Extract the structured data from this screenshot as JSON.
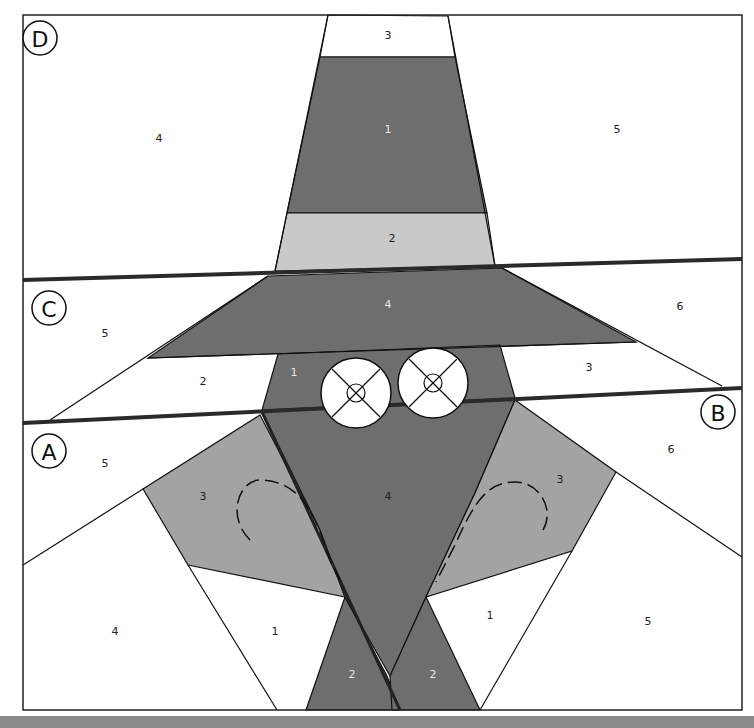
{
  "diagram": {
    "colors": {
      "dark": "#6e6e6e",
      "medium": "#a3a3a3",
      "light": "#c9c9c9",
      "white": "#ffffff",
      "line": "#111111",
      "bottom_bar": "#8a8a8a"
    },
    "sections": [
      {
        "letter": "D",
        "label_pos": [
          40,
          38
        ]
      },
      {
        "letter": "C",
        "label_pos": [
          40,
          308
        ]
      },
      {
        "letter": "A",
        "label_pos": [
          40,
          453
        ]
      },
      {
        "letter": "B",
        "label_pos": [
          717,
          412
        ]
      }
    ],
    "pieces": {
      "D": [
        {
          "num": "3",
          "shade": "white",
          "pos": [
            388,
            36
          ]
        },
        {
          "num": "1",
          "shade": "dark",
          "pos": [
            388,
            130
          ]
        },
        {
          "num": "2",
          "shade": "light",
          "pos": [
            392,
            239
          ]
        },
        {
          "num": "4",
          "shade": "white",
          "pos": [
            159,
            139
          ]
        },
        {
          "num": "5",
          "shade": "white",
          "pos": [
            617,
            130
          ]
        }
      ],
      "C": [
        {
          "num": "4",
          "shade": "dark",
          "pos": [
            388,
            305
          ]
        },
        {
          "num": "5",
          "shade": "white",
          "pos": [
            105,
            334
          ]
        },
        {
          "num": "6",
          "shade": "white",
          "pos": [
            680,
            307
          ]
        },
        {
          "num": "2",
          "shade": "white",
          "pos": [
            203,
            382
          ]
        },
        {
          "num": "1",
          "shade": "dark",
          "pos": [
            294,
            373
          ]
        },
        {
          "num": "3",
          "shade": "white",
          "pos": [
            589,
            368
          ]
        }
      ],
      "A": [
        {
          "num": "5",
          "shade": "white",
          "pos": [
            105,
            464
          ]
        },
        {
          "num": "3",
          "shade": "medium",
          "pos": [
            203,
            497
          ]
        },
        {
          "num": "4",
          "shade": "white",
          "pos": [
            115,
            632
          ]
        },
        {
          "num": "1",
          "shade": "white",
          "pos": [
            275,
            632
          ]
        },
        {
          "num": "2",
          "shade": "dark",
          "pos": [
            352,
            675
          ]
        }
      ],
      "B": [
        {
          "num": "4",
          "shade": "dark",
          "pos": [
            388,
            497
          ]
        },
        {
          "num": "6",
          "shade": "white",
          "pos": [
            671,
            450
          ]
        },
        {
          "num": "3",
          "shade": "medium",
          "pos": [
            560,
            480
          ]
        },
        {
          "num": "1",
          "shade": "white",
          "pos": [
            490,
            616
          ]
        },
        {
          "num": "5",
          "shade": "white",
          "pos": [
            648,
            622
          ]
        },
        {
          "num": "2",
          "shade": "dark",
          "pos": [
            433,
            675
          ]
        }
      ]
    },
    "eyes": [
      {
        "name": "left-eye",
        "cx": 356,
        "cy": 393,
        "r": 35
      },
      {
        "name": "right-eye",
        "cx": 433,
        "cy": 383,
        "r": 35
      }
    ]
  }
}
